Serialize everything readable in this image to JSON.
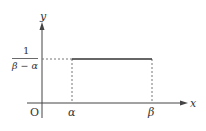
{
  "diagram": {
    "type": "uniform distribution density graph",
    "axes": {
      "x_label": "x",
      "y_label": "y",
      "origin_label": "O"
    },
    "x_ticks": [
      "α",
      "β"
    ],
    "y_value": {
      "numerator": "1",
      "denominator": "β − α"
    },
    "colors": {
      "axis": "#444444",
      "line": "#333333",
      "dotted": "#777777",
      "text": "#333333"
    }
  }
}
